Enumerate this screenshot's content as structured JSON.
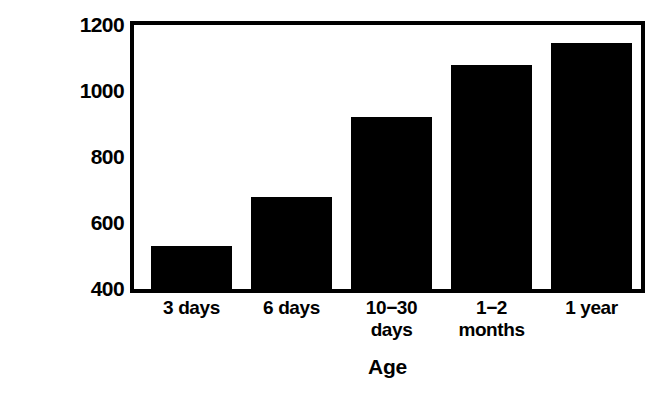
{
  "chart_data": {
    "type": "bar",
    "title": "",
    "xlabel": "Age",
    "ylabel": "Urine, mOsm/kg",
    "categories": [
      "3 days",
      "6 days",
      "10−30\ndays",
      "1−2\nmonths",
      "1 year"
    ],
    "values": [
      530,
      680,
      920,
      1080,
      1145
    ],
    "ylim": [
      400,
      1200
    ],
    "yticks": [
      400,
      600,
      800,
      1000,
      1200
    ],
    "ytick_labels": [
      "400",
      "600",
      "800",
      "1000",
      "1200"
    ],
    "grid": false,
    "legend": "none",
    "bar_color": "#000000",
    "frame_color": "#000000",
    "background_color": "#ffffff"
  },
  "axes": {
    "y_title": "Urine, mOsm/kg",
    "x_title": "Age"
  },
  "bars": [
    {
      "label": "3 days",
      "value": 530,
      "color": "#000000"
    },
    {
      "label": "6 days",
      "value": 680,
      "color": "#000000"
    },
    {
      "label": "10−30 days",
      "value": 920,
      "color": "#000000"
    },
    {
      "label": "1−2 months",
      "value": 1080,
      "color": "#000000"
    },
    {
      "label": "1 year",
      "value": 1145,
      "color": "#000000"
    }
  ]
}
